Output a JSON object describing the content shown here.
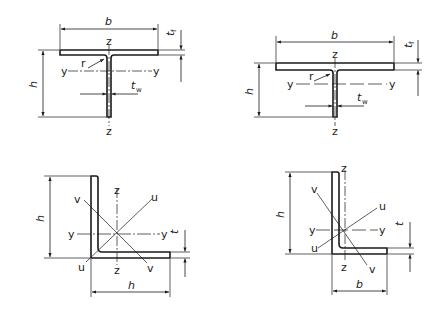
{
  "figure": {
    "colors": {
      "line": "#1a1a1a",
      "background": "#ffffff"
    }
  },
  "sections": [
    {
      "id": "tee-1",
      "type": "T-section",
      "labels": {
        "width": "b",
        "height": "h",
        "flange_thickness": "t",
        "flange_sub": "f",
        "web_thickness": "t",
        "web_sub": "w",
        "radius": "r",
        "axis_y_left": "y",
        "axis_y_right": "y",
        "axis_z_top": "z",
        "axis_z_bottom": "z"
      }
    },
    {
      "id": "tee-2",
      "type": "T-section",
      "labels": {
        "width": "b",
        "height": "h",
        "flange_thickness": "t",
        "flange_sub": "f",
        "web_thickness": "t",
        "web_sub": "w",
        "radius": "r",
        "axis_y_left": "y",
        "axis_y_right": "y",
        "axis_z_top": "z",
        "axis_z_bottom": "z"
      }
    },
    {
      "id": "equal-angle",
      "type": "L-section (equal)",
      "labels": {
        "height": "h",
        "width": "h",
        "thickness": "t",
        "axis_y_left": "y",
        "axis_y_right": "y",
        "axis_z_top": "z",
        "axis_z_bottom": "z",
        "axis_u_top": "u",
        "axis_u_bottom": "u",
        "axis_v_top": "v",
        "axis_v_bottom": "v"
      }
    },
    {
      "id": "unequal-angle",
      "type": "L-section (unequal)",
      "labels": {
        "height": "h",
        "width": "b",
        "thickness": "t",
        "axis_y_left": "y",
        "axis_y_right": "y",
        "axis_z_top": "z",
        "axis_z_bottom": "z",
        "axis_u_top": "u",
        "axis_u_bottom": "u",
        "axis_v_top": "v",
        "axis_v_bottom": "v"
      }
    }
  ]
}
